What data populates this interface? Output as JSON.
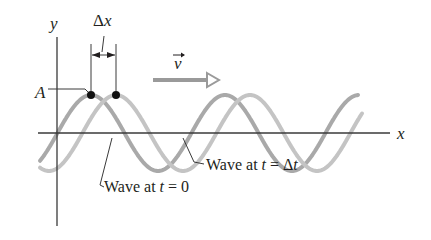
{
  "diagram": {
    "axes": {
      "x_label": "x",
      "y_label": "y",
      "axis_color": "#3a3a3a"
    },
    "amplitude_label": "A",
    "displacement_label": "Δx",
    "velocity_label": "v",
    "velocity_arrow_color": "#9a9a9a",
    "waves": [
      {
        "name": "wave-t0",
        "label": "Wave at t = 0",
        "label_prefix": "Wave at ",
        "label_var": "t",
        "label_rest": " = 0",
        "color": "#a9a9a9",
        "peak_x": 91
      },
      {
        "name": "wave-tdt",
        "label": "Wave at t = Δt",
        "label_prefix": "Wave at ",
        "label_var": "t",
        "label_rest": " = Δ",
        "label_var2": "t",
        "color": "#c4c4c4",
        "peak_x": 116
      }
    ],
    "wavelength_px": 134,
    "amplitude_px": 38,
    "marker_color": "#111111"
  }
}
